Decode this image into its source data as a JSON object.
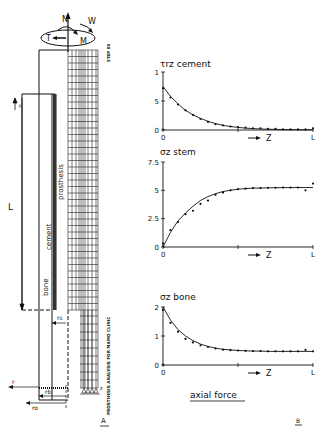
{
  "panel_a": {
    "label": "A",
    "loads": {
      "axial": "N",
      "shear": "T",
      "moment": "M",
      "torsion": "W"
    },
    "length_label": "L",
    "offset_label": "h",
    "regions": {
      "prosthesis": "prosthesis",
      "cement": "cement",
      "bone": "bone"
    },
    "radii": {
      "rs": "rs",
      "rb": "rb",
      "ro": "ro"
    },
    "axes": {
      "r": "r",
      "z": "z"
    },
    "side_text": "PROSTHESIS ANALYSIS FOR MAMO CLINIC",
    "top_text": "STEP 00"
  },
  "panel_b": {
    "label": "B",
    "caption": "axial force",
    "x_arrow_label": "Z",
    "x_start": "0",
    "x_end": "L"
  },
  "chart_data": [
    {
      "type": "line",
      "title": "τrz cement",
      "xlabel": "Z",
      "ylabel": "τrz",
      "x_ticks": [
        "0",
        "",
        "L"
      ],
      "y_ticks": [
        "0",
        "5",
        "1"
      ],
      "ylim": [
        0,
        1
      ],
      "x": [
        0,
        0.05,
        0.1,
        0.15,
        0.2,
        0.25,
        0.3,
        0.35,
        0.4,
        0.45,
        0.5,
        0.55,
        0.6,
        0.65,
        0.7,
        0.75,
        0.8,
        0.85,
        0.9,
        0.95,
        1.0
      ],
      "series": [
        {
          "name": "analytical",
          "values": [
            0.75,
            0.58,
            0.45,
            0.34,
            0.26,
            0.2,
            0.15,
            0.11,
            0.08,
            0.06,
            0.045,
            0.033,
            0.025,
            0.018,
            0.013,
            0.01,
            0.008,
            0.006,
            0.005,
            0.004,
            0.003
          ]
        },
        {
          "name": "FEM",
          "values": [
            0.72,
            0.56,
            0.44,
            0.34,
            0.26,
            0.19,
            0.14,
            0.1,
            0.08,
            0.06,
            0.05,
            0.04,
            0.03,
            0.03,
            0.02,
            0.02,
            0.01,
            0.01,
            0.01,
            0.01,
            0.03
          ]
        }
      ]
    },
    {
      "type": "line",
      "title": "σz stem",
      "xlabel": "Z",
      "ylabel": "σz",
      "x_ticks": [
        "0",
        "",
        "L"
      ],
      "y_ticks": [
        "0",
        "2.5",
        "5",
        "7.5"
      ],
      "ylim": [
        0,
        7.5
      ],
      "x": [
        0,
        0.05,
        0.1,
        0.15,
        0.2,
        0.25,
        0.3,
        0.35,
        0.4,
        0.45,
        0.5,
        0.55,
        0.6,
        0.65,
        0.7,
        0.75,
        0.8,
        0.85,
        0.9,
        0.95,
        1.0
      ],
      "series": [
        {
          "name": "analytical",
          "values": [
            0,
            1.3,
            2.3,
            3.0,
            3.6,
            4.1,
            4.45,
            4.7,
            4.9,
            5.0,
            5.1,
            5.15,
            5.2,
            5.2,
            5.22,
            5.23,
            5.24,
            5.24,
            5.25,
            5.25,
            5.25
          ]
        },
        {
          "name": "FEM",
          "values": [
            0.3,
            1.5,
            2.2,
            2.9,
            3.2,
            3.8,
            4.1,
            4.6,
            4.8,
            5.0,
            5.1,
            5.15,
            5.2,
            5.2,
            5.22,
            5.23,
            5.24,
            5.24,
            5.25,
            5.0,
            5.6
          ]
        }
      ]
    },
    {
      "type": "line",
      "title": "σz bone",
      "xlabel": "Z",
      "ylabel": "σz",
      "x_ticks": [
        "0",
        "",
        "L"
      ],
      "y_ticks": [
        "0",
        "1",
        "2"
      ],
      "ylim": [
        0,
        2
      ],
      "x": [
        0,
        0.05,
        0.1,
        0.15,
        0.2,
        0.25,
        0.3,
        0.35,
        0.4,
        0.45,
        0.5,
        0.55,
        0.6,
        0.65,
        0.7,
        0.75,
        0.8,
        0.85,
        0.9,
        0.95,
        1.0
      ],
      "series": [
        {
          "name": "analytical",
          "values": [
            2.0,
            1.55,
            1.22,
            1.0,
            0.84,
            0.72,
            0.64,
            0.58,
            0.54,
            0.52,
            0.5,
            0.49,
            0.48,
            0.48,
            0.47,
            0.47,
            0.47,
            0.47,
            0.47,
            0.47,
            0.47
          ]
        },
        {
          "name": "FEM",
          "values": [
            1.9,
            1.45,
            1.15,
            0.9,
            0.78,
            0.68,
            0.62,
            0.57,
            0.53,
            0.51,
            0.5,
            0.49,
            0.48,
            0.48,
            0.47,
            0.47,
            0.47,
            0.47,
            0.47,
            0.52,
            0.47
          ]
        }
      ]
    }
  ]
}
